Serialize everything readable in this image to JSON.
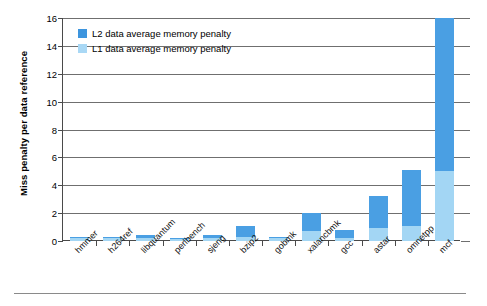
{
  "chart_data": {
    "type": "bar",
    "subtype": "stacked-bar",
    "title": "",
    "xlabel": "",
    "ylabel": "Miss penalty per data reference",
    "ylim": [
      0,
      16
    ],
    "ytick_step": 2,
    "yticks": [
      0,
      2,
      4,
      6,
      8,
      10,
      12,
      14,
      16
    ],
    "ytick_labels": [
      "0",
      "2",
      "4",
      "6",
      "8",
      "10",
      "12",
      "14",
      "16"
    ],
    "grid": true,
    "grid_axis": "y",
    "legend_position": "upper left",
    "categories": [
      "hmmer",
      "h264ref",
      "libquantum",
      "perlbench",
      "sjeng",
      "bzip2",
      "gobmk",
      "xalancbmk",
      "gcc",
      "astar",
      "omnetpp",
      "mcf"
    ],
    "series": [
      {
        "name": "L1 data average memory penalty",
        "color": "#a3d6f4",
        "values": [
          0.2,
          0.2,
          0.25,
          0.15,
          0.2,
          0.3,
          0.2,
          0.75,
          0.25,
          0.9,
          1.1,
          5.0
        ]
      },
      {
        "name": "L2 data average memory penalty",
        "color": "#4a9fe3",
        "values": [
          0.1,
          0.1,
          0.15,
          0.1,
          0.2,
          0.8,
          0.1,
          1.25,
          0.55,
          2.3,
          4.0,
          11.0
        ]
      }
    ],
    "totals": [
      0.3,
      0.3,
      0.4,
      0.25,
      0.4,
      1.1,
      0.3,
      2.0,
      0.8,
      3.2,
      5.1,
      16.0
    ]
  },
  "legend": {
    "items": [
      {
        "label": "L2 data average memory penalty",
        "color": "#3d95de"
      },
      {
        "label": "L1 data average memory penalty",
        "color": "#a9d8f5"
      }
    ]
  }
}
